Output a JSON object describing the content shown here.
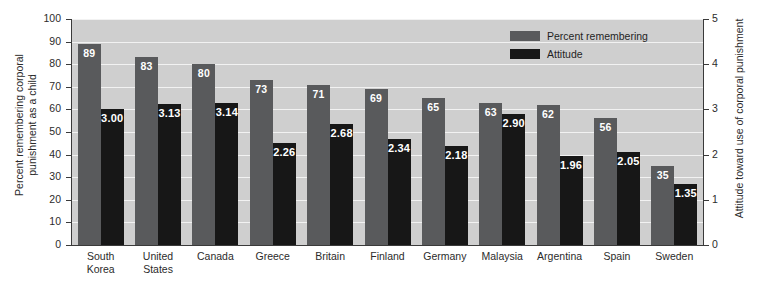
{
  "chart_data": {
    "type": "bar",
    "title": "",
    "subtitle": "",
    "categories": [
      "South\nKorea",
      "United\nStates",
      "Canada",
      "Greece",
      "Britain",
      "Finland",
      "Germany",
      "Malaysia",
      "Argentina",
      "Spain",
      "Sweden"
    ],
    "series": [
      {
        "name": "Percent remembering",
        "axis": "left",
        "color": "#595a5c",
        "values": [
          89,
          83,
          80,
          73,
          71,
          69,
          65,
          63,
          62,
          56,
          35
        ],
        "labels": [
          "89",
          "83",
          "80",
          "73",
          "71",
          "69",
          "65",
          "63",
          "62",
          "56",
          "35"
        ]
      },
      {
        "name": "Attitude",
        "axis": "right",
        "color": "#171717",
        "values": [
          3.0,
          3.13,
          3.14,
          2.26,
          2.68,
          2.34,
          2.18,
          2.9,
          1.96,
          2.05,
          1.35
        ],
        "labels": [
          "3.00",
          "3.13",
          "3.14",
          "2.26",
          "2.68",
          "2.34",
          "2.18",
          "2.90",
          "1.96",
          "2.05",
          "1.35"
        ]
      }
    ],
    "ylabel": "Percent remembering corporal\npunishment as a child",
    "ylabel_right": "Attitude toward use of corporal punishment",
    "xlabel": "",
    "ylim": [
      0,
      100
    ],
    "ylim_right": [
      0,
      5
    ],
    "yticks": [
      0,
      10,
      20,
      30,
      40,
      50,
      60,
      70,
      80,
      90,
      100
    ],
    "yticks_right": [
      0,
      1,
      2,
      3,
      4,
      5
    ],
    "ytick_labels": [
      "0",
      "10",
      "20",
      "30",
      "40",
      "50",
      "60",
      "70",
      "80",
      "90",
      "100"
    ],
    "ytick_labels_right": [
      "0",
      "1",
      "2",
      "3",
      "4",
      "5"
    ],
    "grid": true,
    "grid_color": "#f2f2f2",
    "plot_background": "#cfcfcf",
    "legend_position": "top-right",
    "legend": [
      "Percent remembering",
      "Attitude"
    ]
  },
  "colors": {
    "percent_bar": "#595a5c",
    "attitude_bar": "#171717",
    "plot_bg": "#cfcfcf",
    "gridline": "#f2f2f2",
    "axis": "#3a3a3a",
    "text": "#2b2b2b",
    "value_text": "#ffffff"
  }
}
